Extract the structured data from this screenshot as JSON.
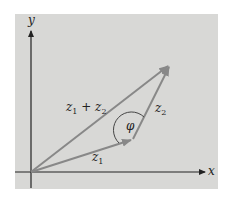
{
  "diagram": {
    "title": "",
    "colors": {
      "background": "#ffffff",
      "panel": "#d8d8d6",
      "axis": "#222222",
      "vector": "#888888",
      "text": "#222222"
    },
    "axes": {
      "x_label": "x",
      "y_label": "y",
      "origin": [
        31,
        172
      ]
    },
    "vectors": [
      {
        "id": "z1",
        "label": "z",
        "subscript": "1",
        "from": [
          31,
          172
        ],
        "to": [
          133,
          139
        ]
      },
      {
        "id": "z2",
        "label": "z",
        "subscript": "2",
        "from": [
          133,
          139
        ],
        "to": [
          170,
          65
        ]
      },
      {
        "id": "z1_plus_z2",
        "label": "z",
        "subscript": "1",
        "plus": " + ",
        "label2": "z",
        "subscript2": "2",
        "from": [
          31,
          172
        ],
        "to": [
          170,
          65
        ]
      }
    ],
    "angle": {
      "label": "φ",
      "vertex": [
        133,
        139
      ]
    }
  }
}
